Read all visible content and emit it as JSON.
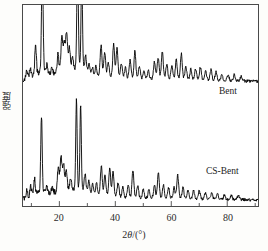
{
  "figure": {
    "background_color": "#fdfdfb",
    "plot_background_color": "#ffffff",
    "frame_color": "#4a4a4a",
    "trace_color": "#000000"
  },
  "axes": {
    "x_title_prefix": "2",
    "x_title_theta": "θ",
    "x_title_suffix": "/(°)",
    "x_title_full": "2θ/(°)",
    "y_title": "强度",
    "x_min": 7,
    "x_max": 91,
    "x_major_ticks": [
      20,
      40,
      60,
      80
    ],
    "x_major_tick_labels": [
      "20",
      "40",
      "60",
      "80"
    ],
    "x_minor_ticks": [
      10,
      30,
      50,
      70,
      90
    ],
    "y_ticks": [],
    "y_tick_labels": [],
    "grid": false
  },
  "series_labels": {
    "bent": "Bent",
    "cs_bent": "CS-Bent"
  },
  "chart_data": {
    "type": "line",
    "title": "",
    "xlabel": "2θ/(°)",
    "ylabel": "强度",
    "xlim": [
      7,
      91
    ],
    "ylim": [
      0,
      100
    ],
    "grid": false,
    "legend_position": "inline-right",
    "series": [
      {
        "name": "Bent",
        "baseline": 62,
        "peaks": [
          {
            "x": 8.3,
            "h": 3,
            "w": 0.45
          },
          {
            "x": 9.6,
            "h": 4,
            "w": 0.4
          },
          {
            "x": 11.5,
            "h": 15,
            "w": 0.4
          },
          {
            "x": 13.9,
            "h": 57,
            "w": 0.38
          },
          {
            "x": 15.6,
            "h": 4,
            "w": 0.4
          },
          {
            "x": 17.4,
            "h": 3,
            "w": 0.4
          },
          {
            "x": 19.5,
            "h": 9,
            "w": 0.4
          },
          {
            "x": 20.9,
            "h": 16,
            "w": 0.5
          },
          {
            "x": 21.8,
            "h": 13,
            "w": 0.45
          },
          {
            "x": 22.6,
            "h": 18,
            "w": 0.45
          },
          {
            "x": 23.6,
            "h": 11,
            "w": 0.45
          },
          {
            "x": 24.7,
            "h": 6,
            "w": 0.45
          },
          {
            "x": 26.5,
            "h": 56,
            "w": 0.36
          },
          {
            "x": 28.0,
            "h": 45,
            "w": 0.36
          },
          {
            "x": 29.4,
            "h": 8,
            "w": 0.45
          },
          {
            "x": 30.6,
            "h": 5,
            "w": 0.45
          },
          {
            "x": 31.8,
            "h": 4,
            "w": 0.45
          },
          {
            "x": 33.1,
            "h": 5,
            "w": 0.45
          },
          {
            "x": 34.9,
            "h": 15,
            "w": 0.45
          },
          {
            "x": 36.2,
            "h": 12,
            "w": 0.45
          },
          {
            "x": 37.5,
            "h": 7,
            "w": 0.45
          },
          {
            "x": 39.4,
            "h": 16,
            "w": 0.45
          },
          {
            "x": 40.6,
            "h": 14,
            "w": 0.45
          },
          {
            "x": 42.2,
            "h": 7,
            "w": 0.45
          },
          {
            "x": 43.6,
            "h": 5,
            "w": 0.45
          },
          {
            "x": 45.3,
            "h": 9,
            "w": 0.45
          },
          {
            "x": 47.0,
            "h": 13,
            "w": 0.45
          },
          {
            "x": 48.6,
            "h": 6,
            "w": 0.45
          },
          {
            "x": 50.2,
            "h": 4,
            "w": 0.45
          },
          {
            "x": 51.8,
            "h": 4,
            "w": 0.45
          },
          {
            "x": 54.0,
            "h": 8,
            "w": 0.45
          },
          {
            "x": 55.3,
            "h": 10,
            "w": 0.45
          },
          {
            "x": 56.8,
            "h": 13,
            "w": 0.45
          },
          {
            "x": 58.4,
            "h": 7,
            "w": 0.45
          },
          {
            "x": 60.2,
            "h": 6,
            "w": 0.45
          },
          {
            "x": 61.8,
            "h": 9,
            "w": 0.45
          },
          {
            "x": 63.6,
            "h": 12,
            "w": 0.45
          },
          {
            "x": 65.2,
            "h": 6,
            "w": 0.45
          },
          {
            "x": 67.0,
            "h": 5,
            "w": 0.45
          },
          {
            "x": 68.7,
            "h": 5,
            "w": 0.45
          },
          {
            "x": 70.4,
            "h": 6,
            "w": 0.45
          },
          {
            "x": 72.3,
            "h": 4,
            "w": 0.45
          },
          {
            "x": 74.2,
            "h": 5,
            "w": 0.45
          },
          {
            "x": 76.0,
            "h": 4,
            "w": 0.45
          },
          {
            "x": 78.1,
            "h": 3,
            "w": 0.45
          },
          {
            "x": 80.3,
            "h": 3,
            "w": 0.45
          },
          {
            "x": 82.5,
            "h": 3,
            "w": 0.45
          },
          {
            "x": 85.0,
            "h": 2,
            "w": 0.45
          }
        ]
      },
      {
        "name": "CS-Bent",
        "baseline": 3,
        "peaks": [
          {
            "x": 8.4,
            "h": 3,
            "w": 0.45
          },
          {
            "x": 9.8,
            "h": 5,
            "w": 0.4
          },
          {
            "x": 11.1,
            "h": 8,
            "w": 0.4
          },
          {
            "x": 13.6,
            "h": 38,
            "w": 0.36
          },
          {
            "x": 15.4,
            "h": 4,
            "w": 0.4
          },
          {
            "x": 17.5,
            "h": 3,
            "w": 0.4
          },
          {
            "x": 19.6,
            "h": 11,
            "w": 0.45
          },
          {
            "x": 20.6,
            "h": 16,
            "w": 0.5
          },
          {
            "x": 21.5,
            "h": 13,
            "w": 0.45
          },
          {
            "x": 22.5,
            "h": 10,
            "w": 0.45
          },
          {
            "x": 24.0,
            "h": 6,
            "w": 0.45
          },
          {
            "x": 26.1,
            "h": 44,
            "w": 0.34
          },
          {
            "x": 27.6,
            "h": 42,
            "w": 0.34
          },
          {
            "x": 29.2,
            "h": 9,
            "w": 0.45
          },
          {
            "x": 30.5,
            "h": 6,
            "w": 0.45
          },
          {
            "x": 31.9,
            "h": 5,
            "w": 0.45
          },
          {
            "x": 33.3,
            "h": 6,
            "w": 0.45
          },
          {
            "x": 35.0,
            "h": 14,
            "w": 0.45
          },
          {
            "x": 36.3,
            "h": 10,
            "w": 0.45
          },
          {
            "x": 38.0,
            "h": 13,
            "w": 0.45
          },
          {
            "x": 39.2,
            "h": 12,
            "w": 0.45
          },
          {
            "x": 41.0,
            "h": 7,
            "w": 0.45
          },
          {
            "x": 42.7,
            "h": 5,
            "w": 0.45
          },
          {
            "x": 44.6,
            "h": 6,
            "w": 0.45
          },
          {
            "x": 46.3,
            "h": 13,
            "w": 0.45
          },
          {
            "x": 48.0,
            "h": 6,
            "w": 0.45
          },
          {
            "x": 50.0,
            "h": 4,
            "w": 0.45
          },
          {
            "x": 52.0,
            "h": 4,
            "w": 0.45
          },
          {
            "x": 54.0,
            "h": 6,
            "w": 0.45
          },
          {
            "x": 55.4,
            "h": 12,
            "w": 0.45
          },
          {
            "x": 57.2,
            "h": 6,
            "w": 0.45
          },
          {
            "x": 59.0,
            "h": 5,
            "w": 0.45
          },
          {
            "x": 61.0,
            "h": 5,
            "w": 0.45
          },
          {
            "x": 62.3,
            "h": 11,
            "w": 0.45
          },
          {
            "x": 64.2,
            "h": 5,
            "w": 0.45
          },
          {
            "x": 66.0,
            "h": 4,
            "w": 0.45
          },
          {
            "x": 68.0,
            "h": 4,
            "w": 0.45
          },
          {
            "x": 70.0,
            "h": 4,
            "w": 0.45
          },
          {
            "x": 72.2,
            "h": 3,
            "w": 0.45
          },
          {
            "x": 74.5,
            "h": 3,
            "w": 0.45
          },
          {
            "x": 76.5,
            "h": 3,
            "w": 0.45
          },
          {
            "x": 79.0,
            "h": 2,
            "w": 0.45
          },
          {
            "x": 81.5,
            "h": 2,
            "w": 0.45
          },
          {
            "x": 84.0,
            "h": 2,
            "w": 0.45
          }
        ]
      }
    ]
  }
}
